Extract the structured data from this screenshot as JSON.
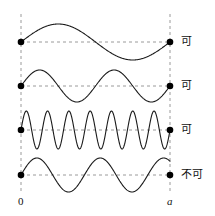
{
  "figure": {
    "width": 215,
    "height": 216,
    "background_color": "#ffffff",
    "wave_color": "#1a1a1a",
    "guide_color": "#9a9a9a",
    "node_color": "#000000"
  },
  "axis": {
    "left_label": "0",
    "right_label": "a",
    "left_x": 21,
    "right_x": 170,
    "label_y": 196
  },
  "rows": [
    {
      "id": "wave-1",
      "label": "可",
      "label_meaning": "allowed",
      "baseline_y": 42,
      "cycles": 1,
      "amplitude": 18,
      "allowed": true,
      "phase": 0,
      "label_x": 181,
      "label_y": 36
    },
    {
      "id": "wave-2",
      "label": "可",
      "label_meaning": "allowed",
      "baseline_y": 86,
      "cycles": 2,
      "amplitude": 16,
      "allowed": true,
      "phase": 0,
      "label_x": 181,
      "label_y": 80
    },
    {
      "id": "wave-3",
      "label": "可",
      "label_meaning": "allowed",
      "baseline_y": 130,
      "cycles": 7,
      "amplitude": 19,
      "allowed": true,
      "phase": 0,
      "label_x": 181,
      "label_y": 124
    },
    {
      "id": "wave-4",
      "label": "不可",
      "label_meaning": "not allowed",
      "baseline_y": 175,
      "cycles": 2.35,
      "amplitude": 17,
      "allowed": false,
      "phase": 0,
      "label_x": 181,
      "label_y": 169
    }
  ],
  "chart_data": {
    "type": "line",
    "xlabel": "",
    "ylabel": "",
    "xlim": [
      0,
      1
    ],
    "grid": false,
    "legend": "right",
    "x_tick_labels": [
      "0",
      "a"
    ],
    "annotations": [
      "可",
      "可",
      "可",
      "不可"
    ],
    "series": [
      {
        "name": "可",
        "cycles": 1,
        "amplitude": 18,
        "node_at_both_ends": true,
        "description": "One full sine period between 0 and a; ends on a node"
      },
      {
        "name": "可",
        "cycles": 2,
        "amplitude": 16,
        "node_at_both_ends": true,
        "description": "Two full sine periods between 0 and a; ends on a node"
      },
      {
        "name": "可",
        "cycles": 7,
        "amplitude": 19,
        "node_at_both_ends": true,
        "description": "Seven full sine periods between 0 and a; ends on a node"
      },
      {
        "name": "不可",
        "cycles": 2.35,
        "amplitude": 17,
        "node_at_both_ends": false,
        "description": "Non-integer number of periods; wave does not return to zero at a"
      }
    ]
  }
}
